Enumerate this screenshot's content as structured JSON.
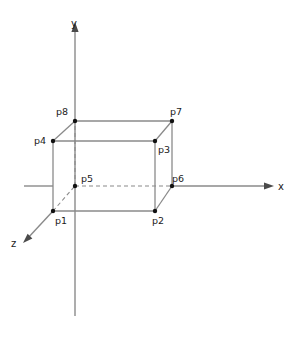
{
  "figure": {
    "background_color": "#ffffff",
    "line_color": "#8a8a8a",
    "dot_color": "#111111",
    "text_color": "#1a1a1a"
  },
  "axes": [
    {
      "id": "y",
      "label": "y",
      "label_x": 74,
      "label_y": 27,
      "orientation": "vertical-up"
    },
    {
      "id": "x",
      "label": "x",
      "label_x": 278,
      "label_y": 190,
      "orientation": "horizontal-right"
    },
    {
      "id": "z",
      "label": "z",
      "label_x": 11,
      "label_y": 247,
      "orientation": "diagonal-down-left"
    }
  ],
  "vertices": [
    {
      "id": "p1",
      "label": "p1",
      "x": 53,
      "y": 211,
      "label_x": 55,
      "label_y": 224
    },
    {
      "id": "p2",
      "label": "p2",
      "x": 155,
      "y": 211,
      "label_x": 152,
      "label_y": 224
    },
    {
      "id": "p3",
      "label": "p3",
      "x": 155,
      "y": 141,
      "label_x": 158,
      "label_y": 153
    },
    {
      "id": "p4",
      "label": "p4",
      "x": 53,
      "y": 141,
      "label_x": 34,
      "label_y": 141
    },
    {
      "id": "p5",
      "label": "p5",
      "x": 75,
      "y": 186,
      "label_x": 81,
      "label_y": 180
    },
    {
      "id": "p6",
      "label": "p6",
      "x": 172,
      "y": 186,
      "label_x": 172,
      "label_y": 181
    },
    {
      "id": "p7",
      "label": "p7",
      "x": 172,
      "y": 121,
      "label_x": 170,
      "label_y": 113
    },
    {
      "id": "p8",
      "label": "p8",
      "x": 75,
      "y": 121,
      "label_x": 56,
      "label_y": 113
    }
  ],
  "edges_visible": [
    {
      "from": "p1",
      "to": "p2"
    },
    {
      "from": "p2",
      "to": "p3"
    },
    {
      "from": "p3",
      "to": "p4"
    },
    {
      "from": "p4",
      "to": "p1"
    },
    {
      "from": "p4",
      "to": "p8"
    },
    {
      "from": "p3",
      "to": "p7"
    },
    {
      "from": "p2",
      "to": "p6"
    },
    {
      "from": "p8",
      "to": "p7"
    },
    {
      "from": "p7",
      "to": "p6"
    }
  ],
  "edges_hidden": [
    {
      "from": "p1",
      "to": "p5"
    },
    {
      "from": "p5",
      "to": "p6"
    },
    {
      "from": "p5",
      "to": "p8"
    }
  ],
  "axis_segments": {
    "y_axis": {
      "x1": 75,
      "y1": 30,
      "x2": 75,
      "y2": 316
    },
    "x_axis_left_stub": {
      "x1": 24,
      "y1": 186,
      "x2": 53,
      "y2": 186
    },
    "x_axis_right": {
      "x1": 172,
      "y1": 186,
      "x2": 272,
      "y2": 186
    },
    "z_axis": {
      "x1": 53,
      "y1": 211,
      "x2": 26,
      "y2": 240
    }
  }
}
